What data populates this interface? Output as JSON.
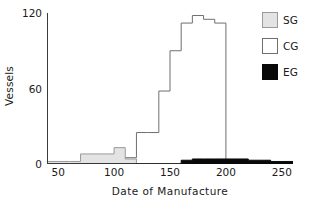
{
  "chart_data": {
    "type": "bar",
    "title": "",
    "xlabel": "Date of Manufacture",
    "ylabel": "Vessels",
    "xlim": [
      40,
      260
    ],
    "ylim": [
      0,
      120
    ],
    "xticks": [
      50,
      100,
      150,
      200,
      250
    ],
    "yticks": [
      0,
      60,
      120
    ],
    "yminorticks": [
      30,
      90
    ],
    "grid": false,
    "legend_position": "right",
    "bin_width": 10,
    "series": [
      {
        "name": "SG",
        "label": "SG",
        "color": "#e3e3e3",
        "edge_color": "#9a9a9a",
        "bin_starts": [
          40,
          50,
          60,
          70,
          80,
          90,
          100,
          110,
          120,
          130,
          140,
          150,
          160,
          170,
          180,
          190,
          200,
          210,
          220,
          230,
          240,
          250
        ],
        "values": [
          2,
          2,
          2,
          8,
          8,
          8,
          13,
          4,
          0,
          0,
          0,
          0,
          0,
          0,
          0,
          0,
          0,
          0,
          0,
          0,
          0,
          0
        ]
      },
      {
        "name": "CG",
        "label": "CG",
        "color": "#ffffff",
        "edge_color": "#6f6f6f",
        "bin_starts": [
          40,
          50,
          60,
          70,
          80,
          90,
          100,
          110,
          120,
          130,
          140,
          150,
          160,
          170,
          180,
          190,
          200,
          210,
          220,
          230,
          240,
          250
        ],
        "values": [
          1,
          1,
          1,
          1,
          1,
          1,
          2,
          5,
          25,
          25,
          58,
          90,
          112,
          118,
          115,
          112,
          0,
          0,
          0,
          0,
          0,
          0
        ]
      },
      {
        "name": "EG",
        "label": "EG",
        "color": "#090909",
        "edge_color": "#090909",
        "bin_starts": [
          40,
          50,
          60,
          70,
          80,
          90,
          100,
          110,
          120,
          130,
          140,
          150,
          160,
          170,
          180,
          190,
          200,
          210,
          220,
          230,
          240,
          250
        ],
        "values": [
          0,
          0,
          0,
          0,
          0,
          0,
          0,
          0,
          0,
          0,
          0,
          0,
          3,
          4,
          4,
          4,
          4,
          4,
          3,
          3,
          2,
          2
        ]
      }
    ]
  },
  "axes": {
    "x_title": "Date of Manufacture",
    "y_title": "Vessels",
    "x_tick_labels": [
      "50",
      "100",
      "150",
      "200",
      "250"
    ],
    "y_tick_labels": [
      "0",
      "60",
      "120"
    ]
  },
  "legend": {
    "items": [
      {
        "label": "SG",
        "swatch": "#e3e3e3",
        "border": "#9a9a9a"
      },
      {
        "label": "CG",
        "swatch": "#ffffff",
        "border": "#6f6f6f"
      },
      {
        "label": "EG",
        "swatch": "#090909",
        "border": "#090909"
      }
    ]
  }
}
